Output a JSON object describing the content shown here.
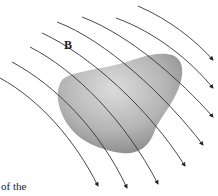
{
  "figure": {
    "field_label": "B",
    "caption_fragment": "of the",
    "object": "irregular-gray-blob",
    "field_line_count": 10,
    "colors": {
      "line": "#333333",
      "blob_light": "#d8d8d8",
      "blob_dark": "#8a8a8a",
      "background": "#ffffff"
    }
  }
}
